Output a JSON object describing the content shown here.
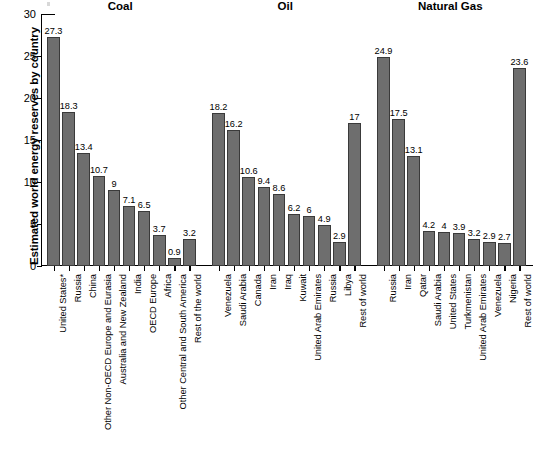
{
  "chart_data": {
    "type": "bar",
    "title": "",
    "xlabel": "",
    "ylabel": "Estimated world energy reserves by country",
    "ylim": [
      0,
      30
    ],
    "yticks": [
      0,
      5,
      10,
      15,
      20,
      25,
      30
    ],
    "grid": false,
    "legend": "none",
    "bar_color": "#6e6e6e",
    "bar_edge_color": "#3a3a3a",
    "groups": [
      {
        "name": "Coal",
        "categories": [
          "United States*",
          "Russia",
          "China",
          "Other Non-OECD Europe and Eurasia",
          "Australia and New Zealand",
          "India",
          "OECD Europe",
          "Africa",
          "Other Central and South America",
          "Rest of the world"
        ],
        "values": [
          27.3,
          18.3,
          13.4,
          10.7,
          9,
          7.1,
          6.5,
          3.7,
          0.9,
          3.2
        ],
        "value_labels": [
          "27.3",
          "18.3",
          "13.4",
          "10.7",
          "9",
          "7.1",
          "6.5",
          "3.7",
          "0.9",
          "3.2"
        ]
      },
      {
        "name": "Oil",
        "categories": [
          "Venezuela",
          "Saudi Arabia",
          "Canada",
          "Iran",
          "Iraq",
          "Kuwait",
          "United Arab Emirates",
          "Russia",
          "Libya",
          "Rest of world"
        ],
        "values": [
          18.2,
          16.2,
          10.6,
          9.4,
          8.6,
          6.2,
          6,
          4.9,
          2.9,
          17
        ],
        "value_labels": [
          "18.2",
          "16.2",
          "10.6",
          "9.4",
          "8.6",
          "6.2",
          "6",
          "4.9",
          "2.9",
          "17"
        ]
      },
      {
        "name": "Natural Gas",
        "categories": [
          "Russia",
          "Iran",
          "Qatar",
          "Saudi Arabia",
          "United States",
          "Turkmenistan",
          "United Arab Emirates",
          "Venezuela",
          "Nigeria",
          "Rest of world"
        ],
        "values": [
          24.9,
          17.5,
          13.1,
          4.2,
          4,
          3.9,
          3.2,
          2.9,
          2.7,
          23.6
        ],
        "value_labels": [
          "24.9",
          "17.5",
          "13.1",
          "4.2",
          "4",
          "3.9",
          "3.2",
          "2.9",
          "2.7",
          "23.6"
        ]
      }
    ]
  }
}
